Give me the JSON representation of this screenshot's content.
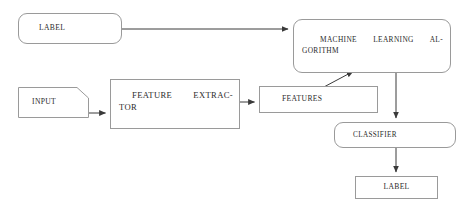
{
  "diagram": {
    "type": "flowchart",
    "canvas": {
      "width": 469,
      "height": 207,
      "background": "#ffffff"
    },
    "style": {
      "stroke": "#9a9a9a",
      "edge_stroke": "#3a3a3a",
      "text_color": "#2b2b2b"
    },
    "nodes": [
      {
        "id": "label_top",
        "label": "LABEL",
        "shape": "rounded-rectangle",
        "x": 18,
        "y": 13,
        "width": 104,
        "height": 31
      },
      {
        "id": "input",
        "label": "INPUT",
        "shape": "document-cut-corner",
        "x": 18,
        "y": 87,
        "width": 71,
        "height": 31
      },
      {
        "id": "feature_extractor",
        "label": "FEATURE EXTRACTOR",
        "line1": "FEATURE EXTRAC-",
        "line2": "TOR",
        "shape": "rectangle",
        "x": 110,
        "y": 79,
        "width": 130,
        "height": 50
      },
      {
        "id": "features",
        "label": "FEATURES",
        "shape": "rectangle",
        "x": 259,
        "y": 86,
        "width": 119,
        "height": 27
      },
      {
        "id": "ml_algorithm",
        "label": "MACHINE LEARNING ALGORITHM",
        "line1": "MACHINE LEARNING AL-",
        "line2": "GORITHM",
        "shape": "rounded-rectangle",
        "x": 293,
        "y": 19,
        "width": 158,
        "height": 54
      },
      {
        "id": "classifier",
        "label": "CLASSIFIER",
        "shape": "rounded-rectangle",
        "x": 334,
        "y": 122,
        "width": 122,
        "height": 26
      },
      {
        "id": "label_bottom",
        "label": "LABEL",
        "shape": "rectangle",
        "x": 355,
        "y": 176,
        "width": 83,
        "height": 23
      }
    ],
    "edges": [
      {
        "id": "e1",
        "from": "label_top",
        "to": "ml_algorithm",
        "kind": "horizontal-arrow"
      },
      {
        "id": "e2",
        "from": "input",
        "to": "feature_extractor",
        "kind": "horizontal-arrow"
      },
      {
        "id": "e3",
        "from": "feature_extractor",
        "to": "features",
        "kind": "horizontal-arrow"
      },
      {
        "id": "e4",
        "from": "features",
        "to": "ml_algorithm",
        "kind": "diagonal-arrow"
      },
      {
        "id": "e5",
        "from": "ml_algorithm",
        "to": "classifier",
        "kind": "vertical-arrow"
      },
      {
        "id": "e6",
        "from": "classifier",
        "to": "label_bottom",
        "kind": "vertical-arrow"
      }
    ]
  }
}
